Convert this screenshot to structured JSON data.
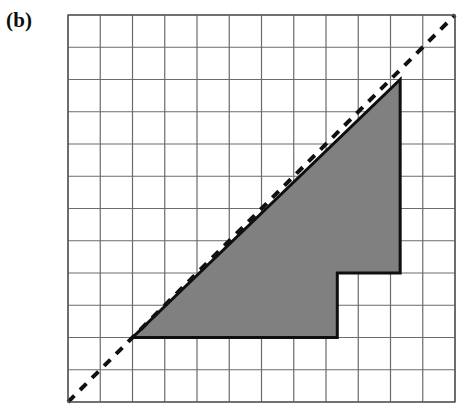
{
  "figure": {
    "panel_label": "(b)",
    "caption_text": "(b)",
    "background_color": "#ffffff"
  },
  "grid": {
    "label": "square grid",
    "columns": 12,
    "rows": 12,
    "origin_x_px": 68,
    "origin_y_px": 15,
    "cell_size_px": 32.25,
    "line_color": "#6b6b6b",
    "line_width_px": 1.2,
    "border_color": "#555555",
    "border_width_px": 1.4
  },
  "diagonal": {
    "label": "dashed diagonal reference line",
    "style": "dashed",
    "color": "#111111",
    "width_px": 4,
    "dash_pattern": "9 8",
    "from_cell": [
      0,
      0
    ],
    "to_cell": [
      12,
      12
    ],
    "equation": "y = x"
  },
  "region": {
    "label": "shaded staircase region under diagonal",
    "fill_color": "#808080",
    "stroke_color": "#0f0f0f",
    "stroke_width_px": 3,
    "vertices_cells": [
      [
        2,
        2
      ],
      [
        8.35,
        2
      ],
      [
        8.35,
        4
      ],
      [
        10.3,
        4
      ],
      [
        10.3,
        10
      ],
      [
        2,
        2
      ]
    ],
    "vertex_labels": [
      "lower-left apex on diagonal",
      "bottom edge right end",
      "inner step corner",
      "step shelf right end",
      "upper-right corner on diagonal",
      "close along diagonal"
    ]
  },
  "chart_data": {
    "type": "area",
    "title": "(b)",
    "xlabel": "",
    "ylabel": "",
    "xlim": [
      0,
      12
    ],
    "ylim": [
      0,
      12
    ],
    "grid": true,
    "legend": "none",
    "series": [
      {
        "name": "dashed diagonal y = x",
        "style": "dashed-line",
        "x": [
          0,
          12
        ],
        "values": [
          0,
          12
        ]
      },
      {
        "name": "shaded staircase region",
        "style": "filled-polygon",
        "x": [
          2,
          8.35,
          8.35,
          10.3,
          10.3,
          2
        ],
        "values": [
          2,
          2,
          4,
          4,
          10,
          2
        ]
      }
    ],
    "annotations": [
      {
        "text": "(b)",
        "x": 0,
        "y": 12,
        "position": "outside-top-left"
      }
    ]
  }
}
